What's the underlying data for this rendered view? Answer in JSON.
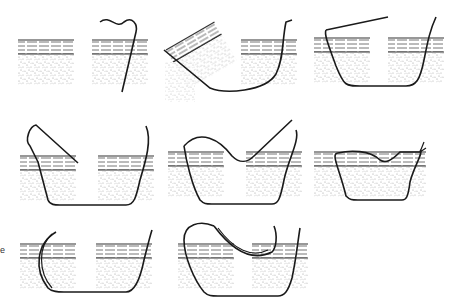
{
  "figure": {
    "edge_label": "e",
    "colors": {
      "background": "#ffffff",
      "ink": "#1a1a1a",
      "stipple": "#9a9a9a",
      "dermis_line": "#555555"
    },
    "rows": [
      {
        "panels": [
          {
            "id": "panel-1",
            "step": "needle entering skin vertically"
          },
          {
            "id": "panel-2",
            "step": "tissue everted, needle passing under wound"
          },
          {
            "id": "panel-3",
            "step": "needle exiting opposite side"
          }
        ]
      },
      {
        "panels": [
          {
            "id": "panel-4",
            "step": "suture loop formed over wound"
          },
          {
            "id": "panel-5",
            "step": "suture crossing wound superficially"
          },
          {
            "id": "panel-6",
            "step": "suture tied, wound edges approximated"
          }
        ]
      },
      {
        "panels": [
          {
            "id": "panel-7",
            "step": "curved needle path through both edges"
          },
          {
            "id": "panel-8",
            "step": "curved needle returning superficially"
          }
        ]
      }
    ]
  }
}
